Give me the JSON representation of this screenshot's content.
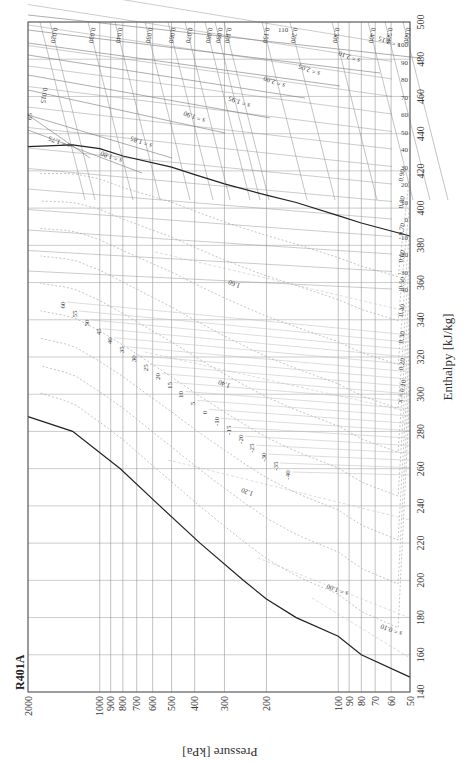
{
  "chart_data": {
    "type": "line",
    "title": "R401A",
    "subtype": "pressure-enthalpy diagram (rotated 90 degrees)",
    "xlabel": "Enthalpy [kJ/kg]",
    "ylabel": "Pressure [kPa]",
    "enthalpy_axis": {
      "range": [
        140,
        500
      ],
      "ticks": [
        140,
        160,
        180,
        200,
        220,
        240,
        260,
        280,
        300,
        320,
        340,
        360,
        380,
        400,
        420,
        440,
        460,
        480,
        500
      ]
    },
    "pressure_axis": {
      "scale": "log",
      "range": [
        50,
        2000
      ],
      "ticks": [
        50,
        60,
        70,
        80,
        90,
        100,
        200,
        300,
        400,
        500,
        600,
        700,
        800,
        900,
        1000,
        2000
      ],
      "tick_labels": [
        "50",
        "60",
        "70",
        "80",
        "90",
        "100",
        "200",
        "300",
        "400",
        "500",
        "600",
        "700",
        "800",
        "900",
        "1000",
        "2000"
      ]
    },
    "grid": true,
    "saturated_liquid_line": {
      "name": "saturated liquid",
      "points": [
        [
          148,
          50
        ],
        [
          160,
          80
        ],
        [
          170,
          100
        ],
        [
          180,
          150
        ],
        [
          190,
          200
        ],
        [
          200,
          250
        ],
        [
          220,
          380
        ],
        [
          240,
          560
        ],
        [
          260,
          820
        ],
        [
          280,
          1300
        ],
        [
          288,
          2000
        ]
      ]
    },
    "saturated_vapor_line": {
      "name": "saturated vapor",
      "points": [
        [
          385,
          50
        ],
        [
          392,
          80
        ],
        [
          396,
          100
        ],
        [
          403,
          150
        ],
        [
          407,
          200
        ],
        [
          413,
          300
        ],
        [
          418,
          400
        ],
        [
          422,
          500
        ],
        [
          428,
          800
        ],
        [
          432,
          1000
        ],
        [
          434,
          1300
        ],
        [
          433,
          2000
        ]
      ]
    },
    "quality_lines": {
      "labels": [
        "x = 0.10",
        "0.20",
        "0.30",
        "0.40",
        "0.50",
        "0.60",
        "0.70",
        "0.80",
        "0.90"
      ],
      "values": [
        0.1,
        0.2,
        0.3,
        0.4,
        0.5,
        0.6,
        0.7,
        0.8,
        0.9
      ]
    },
    "isotherms_twophase": {
      "labels": [
        "60",
        "55",
        "50",
        "45",
        "40",
        "35",
        "30",
        "25",
        "20",
        "15",
        "10",
        "5",
        "0",
        "-10",
        "-15",
        "-20",
        "-25",
        "-30",
        "-35",
        "-40"
      ]
    },
    "isotherms_vapor": {
      "labels": [
        "100",
        "90",
        "80",
        "70",
        "60",
        "50",
        "40",
        "30",
        "20",
        "10",
        "0",
        "-10",
        "-20",
        "-30",
        "-40"
      ],
      "critical_label": "65"
    },
    "isentropes": {
      "labels": [
        "s = 0.10",
        "s = 1.00",
        "1.20",
        "1.40",
        "1.60",
        "s = 1.75",
        "s = 1.80",
        "s = 1.85",
        "s = 1.90",
        "s = 1.95",
        "s = 2.00",
        "s = 2.05",
        "s = 2.10",
        "s = 2.15"
      ],
      "values": [
        0.1,
        1.0,
        1.2,
        1.4,
        1.6,
        1.75,
        1.8,
        1.85,
        1.9,
        1.95,
        2.0,
        2.05,
        2.1,
        2.15
      ]
    },
    "isochores": {
      "labels": [
        "0.015",
        "0.020",
        "0.030",
        "0.040",
        "0.050",
        "0.060",
        "0.070",
        "0.080",
        "0.090",
        "0.100",
        "0.150",
        "0.200",
        "0.300",
        "0.400",
        "0.500",
        "0.600"
      ],
      "values": [
        0.015,
        0.02,
        0.03,
        0.04,
        0.05,
        0.06,
        0.07,
        0.08,
        0.09,
        0.1,
        0.15,
        0.2,
        0.3,
        0.4,
        0.5,
        0.6
      ],
      "extra_label": "110"
    },
    "legend": "none",
    "colors": {
      "line": "#333333",
      "grid": "#999999",
      "saturation": "#222222",
      "dashed": "#aaaaaa"
    }
  }
}
